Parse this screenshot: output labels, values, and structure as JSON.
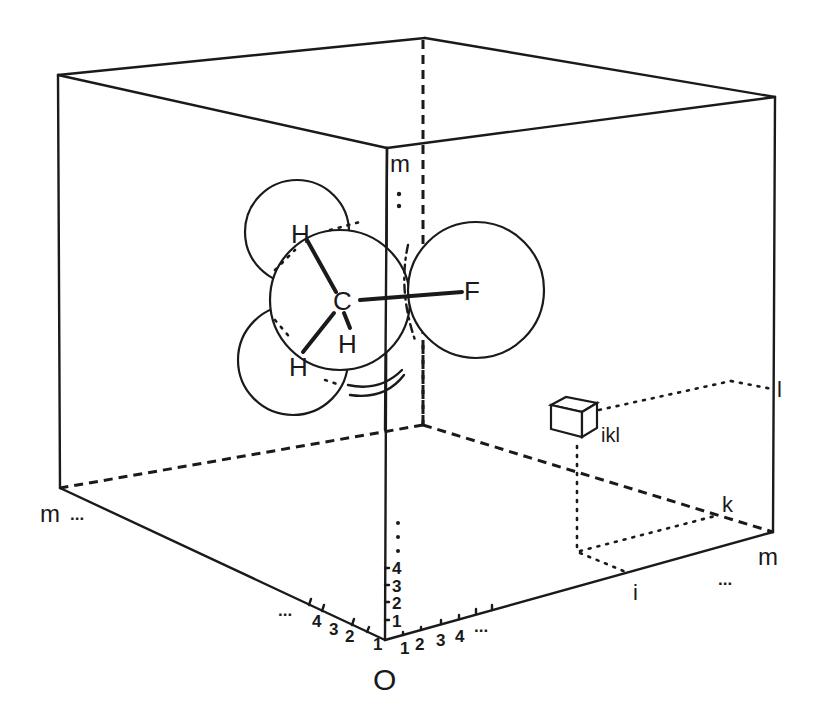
{
  "diagram": {
    "type": "3D lattice cube with molecule (CH3F) and voxel",
    "molecule": {
      "atoms": [
        {
          "symbol": "C",
          "label": "C"
        },
        {
          "symbol": "F",
          "label": "F"
        },
        {
          "symbol": "H",
          "label": "H"
        },
        {
          "symbol": "H",
          "label": "H"
        },
        {
          "symbol": "H",
          "label": "H"
        }
      ]
    },
    "axes": {
      "origin": "O",
      "left_axis": {
        "ticks": [
          "1",
          "2",
          "3",
          "4"
        ],
        "ellipsis": "...",
        "end_label": "m"
      },
      "right_axis": {
        "ticks": [
          "1",
          "2",
          "3",
          "4"
        ],
        "ellipsis": "...",
        "end_label": "m"
      },
      "vertical_axis": {
        "ticks": [
          "1",
          "2",
          "3",
          "4"
        ],
        "ellipsis": ":",
        "end_label": "m"
      }
    },
    "voxel": {
      "label": "ikl",
      "coord_labels": {
        "i": "i",
        "k": "k",
        "l": "l"
      }
    },
    "colors": {
      "ink": "#1a1a1a",
      "background": "#ffffff"
    }
  }
}
